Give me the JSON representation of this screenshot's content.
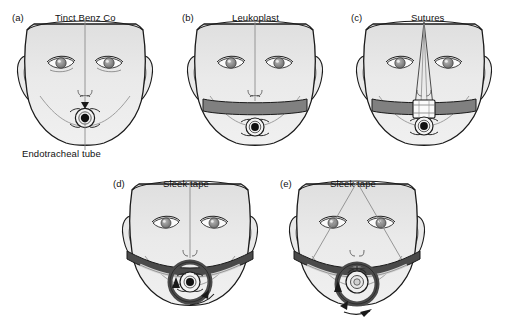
{
  "figure": {
    "background_color": "#ffffff",
    "skin_fill": "#ebebeb",
    "skin_fill_top": "#e0e0e0",
    "outline_color": "#1a1a1a",
    "leukoplast_color": "#808080",
    "sleek_tape_color": "#4a4a4a",
    "label_color": "#111111"
  },
  "panels": [
    {
      "id": "(a)",
      "name": "panel-a",
      "labels": [
        {
          "text": "Tinct Benz Co",
          "role": "top-label"
        },
        {
          "text": "Endotracheal tube",
          "role": "bottom-label"
        }
      ]
    },
    {
      "id": "(b)",
      "name": "panel-b",
      "labels": [
        {
          "text": "Leukoplast",
          "role": "top-label"
        }
      ]
    },
    {
      "id": "(c)",
      "name": "panel-c",
      "labels": [
        {
          "text": "Sutures",
          "role": "top-label"
        }
      ]
    },
    {
      "id": "(d)",
      "name": "panel-d",
      "labels": [
        {
          "text": "Sleek tape",
          "role": "top-label"
        }
      ]
    },
    {
      "id": "(e)",
      "name": "panel-e",
      "labels": [
        {
          "text": "Sleek tape",
          "role": "top-label"
        }
      ]
    }
  ]
}
